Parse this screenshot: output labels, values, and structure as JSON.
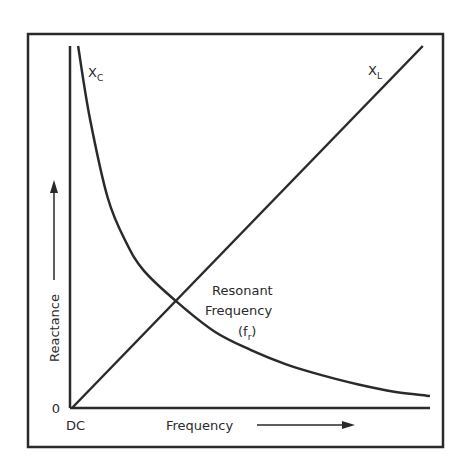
{
  "chart_data": {
    "type": "line",
    "title": "",
    "xlabel": "Frequency",
    "ylabel": "Reactance",
    "x_origin_label": "DC",
    "y_origin_label": "0",
    "xlim": [
      0,
      1
    ],
    "ylim": [
      0,
      1
    ],
    "grid": false,
    "series": [
      {
        "name": "XL",
        "label_main": "X",
        "label_sub": "L",
        "x": [
          0,
          0.98
        ],
        "y": [
          0,
          1.0
        ]
      },
      {
        "name": "XC",
        "label_main": "X",
        "label_sub": "C",
        "x": [
          0.017,
          0.05,
          0.1,
          0.15,
          0.2,
          0.293,
          0.4,
          0.5,
          0.6,
          0.7,
          0.8,
          0.9,
          1.0
        ],
        "y": [
          1.0,
          0.8,
          0.58,
          0.46,
          0.38,
          0.293,
          0.21,
          0.16,
          0.12,
          0.09,
          0.065,
          0.045,
          0.033
        ]
      }
    ],
    "annotations": [
      {
        "lines": [
          "Resonant",
          "Frequency"
        ],
        "symbol_main": "f",
        "symbol_sub": "r",
        "points_to": {
          "x": 0.293,
          "y": 0.293
        }
      }
    ]
  }
}
